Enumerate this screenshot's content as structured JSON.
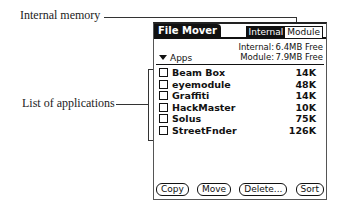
{
  "callouts": {
    "internal_memory": "Internal memory",
    "list_of_applications": "List of applications"
  },
  "app": {
    "title": "File Mover",
    "segments": [
      {
        "label": "Internal",
        "selected": true
      },
      {
        "label": "Module",
        "selected": false
      }
    ],
    "memory": {
      "internal_label": "Internal:",
      "internal_value": "6.4MB Free",
      "module_label": "Module:",
      "module_value": "7.9MB Free"
    },
    "category": "Apps",
    "files": [
      {
        "name": "Beam Box",
        "size": "14K"
      },
      {
        "name": "eyemodule",
        "size": "48K"
      },
      {
        "name": "Graffiti",
        "size": "14K"
      },
      {
        "name": "HackMaster",
        "size": "10K"
      },
      {
        "name": "Solus",
        "size": "75K"
      },
      {
        "name": "StreetFnder",
        "size": "126K"
      }
    ],
    "buttons": {
      "copy": "Copy",
      "move": "Move",
      "delete": "Delete...",
      "sort": "Sort"
    }
  }
}
